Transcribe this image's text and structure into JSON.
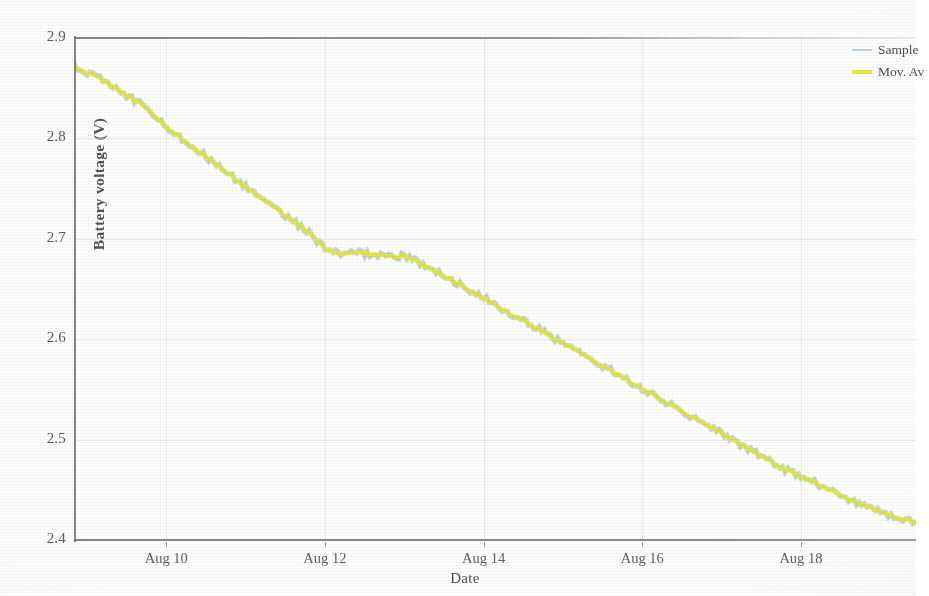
{
  "chart_data": {
    "type": "line",
    "title": "",
    "xlabel": "Date",
    "ylabel": "Battery voltage (V)",
    "ylim": [
      2.4,
      2.9
    ],
    "yticks": [
      "2.4",
      "2.5",
      "2.6",
      "2.7",
      "2.8",
      "2.9"
    ],
    "ytick_values": [
      2.4,
      2.5,
      2.6,
      2.7,
      2.8,
      2.9
    ],
    "xticks": [
      "Aug 10",
      "Aug 12",
      "Aug 14",
      "Aug 16",
      "Aug 18"
    ],
    "xtick_values": [
      10,
      12,
      14,
      16,
      18
    ],
    "xlim": [
      8.85,
      19.45
    ],
    "grid": true,
    "legend_position": "top-right",
    "series": [
      {
        "name": "Sample",
        "color": "#bcd8e8",
        "style": "noisy-line",
        "x": [
          8.85,
          9.0,
          9.2,
          9.4,
          9.6,
          9.8,
          10.0,
          10.2,
          10.4,
          10.6,
          10.8,
          11.0,
          11.2,
          11.4,
          11.6,
          11.8,
          12.0,
          12.2,
          12.4,
          12.6,
          12.8,
          13.0,
          13.2,
          13.4,
          13.6,
          13.8,
          14.0,
          14.2,
          14.4,
          14.6,
          14.8,
          15.0,
          15.2,
          15.4,
          15.6,
          15.8,
          16.0,
          16.2,
          16.4,
          16.6,
          16.8,
          17.0,
          17.2,
          17.4,
          17.6,
          17.8,
          18.0,
          18.2,
          18.4,
          18.6,
          18.8,
          19.0,
          19.2,
          19.45
        ],
        "values": [
          2.872,
          2.866,
          2.858,
          2.848,
          2.838,
          2.827,
          2.812,
          2.8,
          2.788,
          2.776,
          2.764,
          2.752,
          2.74,
          2.729,
          2.718,
          2.706,
          2.69,
          2.684,
          2.686,
          2.685,
          2.682,
          2.683,
          2.676,
          2.668,
          2.659,
          2.65,
          2.641,
          2.632,
          2.623,
          2.614,
          2.605,
          2.596,
          2.587,
          2.578,
          2.569,
          2.56,
          2.551,
          2.542,
          2.533,
          2.524,
          2.515,
          2.506,
          2.497,
          2.488,
          2.479,
          2.47,
          2.464,
          2.456,
          2.448,
          2.441,
          2.434,
          2.428,
          2.423,
          2.418
        ]
      },
      {
        "name": "Mov. Av",
        "color": "#eded3a",
        "style": "smooth-line",
        "x": [
          8.85,
          9.0,
          9.2,
          9.4,
          9.6,
          9.8,
          10.0,
          10.2,
          10.4,
          10.6,
          10.8,
          11.0,
          11.2,
          11.4,
          11.6,
          11.8,
          12.0,
          12.2,
          12.4,
          12.6,
          12.8,
          13.0,
          13.2,
          13.4,
          13.6,
          13.8,
          14.0,
          14.2,
          14.4,
          14.6,
          14.8,
          15.0,
          15.2,
          15.4,
          15.6,
          15.8,
          16.0,
          16.2,
          16.4,
          16.6,
          16.8,
          17.0,
          17.2,
          17.4,
          17.6,
          17.8,
          18.0,
          18.2,
          18.4,
          18.6,
          18.8,
          19.0,
          19.2,
          19.45
        ],
        "values": [
          2.872,
          2.866,
          2.858,
          2.848,
          2.838,
          2.827,
          2.812,
          2.8,
          2.788,
          2.776,
          2.764,
          2.752,
          2.74,
          2.729,
          2.718,
          2.706,
          2.69,
          2.684,
          2.686,
          2.685,
          2.682,
          2.683,
          2.676,
          2.668,
          2.659,
          2.65,
          2.641,
          2.632,
          2.623,
          2.614,
          2.605,
          2.596,
          2.587,
          2.578,
          2.569,
          2.56,
          2.551,
          2.542,
          2.533,
          2.524,
          2.515,
          2.506,
          2.497,
          2.488,
          2.479,
          2.47,
          2.464,
          2.456,
          2.448,
          2.441,
          2.434,
          2.428,
          2.423,
          2.418
        ]
      }
    ]
  },
  "legend": {
    "items": [
      {
        "label": "Sample",
        "color": "#bcd8e8"
      },
      {
        "label": "Mov. Av",
        "color": "#eded3a"
      }
    ]
  },
  "axes": {
    "y_title": "Battery voltage (V)",
    "x_title": "Date"
  }
}
